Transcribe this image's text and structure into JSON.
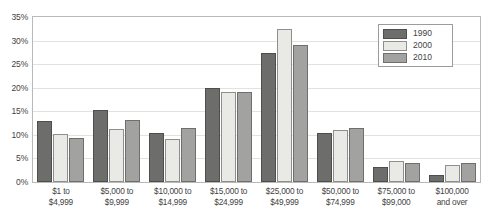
{
  "chart_data": {
    "type": "bar",
    "title": "",
    "subtitle": "",
    "xlabel": "",
    "ylabel": "",
    "ylim": [
      0,
      35
    ],
    "ytick_labels": [
      "0%",
      "5%",
      "10%",
      "15%",
      "20%",
      "25%",
      "30%",
      "35%"
    ],
    "ytick_values": [
      0,
      5,
      10,
      15,
      20,
      25,
      30,
      35
    ],
    "grid": true,
    "legend_position": "top-right-inside",
    "value_suffix": "%",
    "categories": [
      "$1 to|$4,999",
      "$5,000 to|$9,999",
      "$10,000 to|$14,999",
      "$15,000 to|$24,999",
      "$25,000 to|$49,999",
      "$50,000 to|$74,999",
      "$75,000 to|$99,000",
      "$100,000|and over"
    ],
    "series": [
      {
        "name": "1990",
        "color": "#6d6d6b",
        "values": [
          13.0,
          15.2,
          10.5,
          20.0,
          27.4,
          10.3,
          3.2,
          1.4
        ]
      },
      {
        "name": "2000",
        "color": "#e9e9e6",
        "values": [
          10.1,
          11.3,
          9.2,
          19.0,
          32.4,
          11.1,
          4.5,
          3.6
        ]
      },
      {
        "name": "2010",
        "color": "#a2a2a0",
        "values": [
          9.4,
          13.2,
          11.4,
          19.0,
          29.0,
          11.4,
          4.0,
          4.0
        ]
      }
    ]
  }
}
